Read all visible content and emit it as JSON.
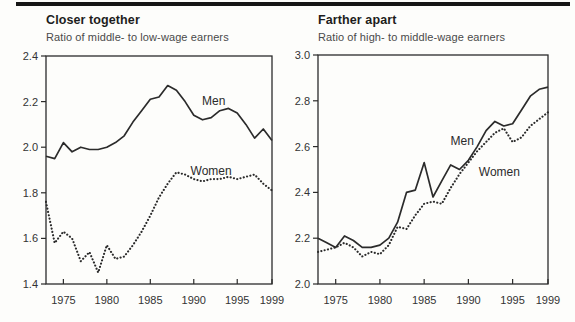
{
  "page": {
    "background": "#fdfdfb",
    "top_rule_color": "#161616",
    "line_color": "#2b2b2b"
  },
  "chart_data": [
    {
      "id": "left-panel",
      "type": "line",
      "title": "Closer together",
      "subtitle": "Ratio of middle- to low-wage earners",
      "x": [
        1973,
        1974,
        1975,
        1976,
        1977,
        1978,
        1979,
        1980,
        1981,
        1982,
        1983,
        1984,
        1985,
        1986,
        1987,
        1988,
        1989,
        1990,
        1991,
        1992,
        1993,
        1994,
        1995,
        1996,
        1997,
        1998,
        1999
      ],
      "x_ticks": [
        1975,
        1980,
        1985,
        1990,
        1995,
        1999
      ],
      "ylim": [
        1.4,
        2.4
      ],
      "y_ticks": [
        1.4,
        1.6,
        1.8,
        2.0,
        2.2,
        2.4
      ],
      "grid": false,
      "legend": "inline-labels",
      "series": [
        {
          "name": "Men",
          "style": "solid",
          "color": "#2b2b2b",
          "values": [
            1.96,
            1.95,
            2.02,
            1.98,
            2.0,
            1.99,
            1.99,
            2.0,
            2.02,
            2.05,
            2.11,
            2.16,
            2.21,
            2.22,
            2.27,
            2.25,
            2.2,
            2.14,
            2.12,
            2.13,
            2.16,
            2.17,
            2.15,
            2.1,
            2.04,
            2.08,
            2.03
          ],
          "label": {
            "x": 1992.3,
            "y": 2.185
          }
        },
        {
          "name": "Women",
          "style": "dotted",
          "color": "#2b2b2b",
          "values": [
            1.76,
            1.58,
            1.63,
            1.6,
            1.5,
            1.54,
            1.45,
            1.57,
            1.51,
            1.52,
            1.57,
            1.63,
            1.7,
            1.78,
            1.84,
            1.89,
            1.88,
            1.86,
            1.85,
            1.86,
            1.86,
            1.87,
            1.86,
            1.87,
            1.88,
            1.84,
            1.81
          ],
          "label": {
            "x": 1992.0,
            "y": 1.878
          }
        }
      ]
    },
    {
      "id": "right-panel",
      "type": "line",
      "title": "Farther apart",
      "subtitle": "Ratio of high- to middle-wage earners",
      "x": [
        1973,
        1974,
        1975,
        1976,
        1977,
        1978,
        1979,
        1980,
        1981,
        1982,
        1983,
        1984,
        1985,
        1986,
        1987,
        1988,
        1989,
        1990,
        1991,
        1992,
        1993,
        1994,
        1995,
        1996,
        1997,
        1998,
        1999
      ],
      "x_ticks": [
        1975,
        1980,
        1985,
        1990,
        1995,
        1999
      ],
      "ylim": [
        2.0,
        3.0
      ],
      "y_ticks": [
        2.0,
        2.2,
        2.4,
        2.6,
        2.8,
        3.0
      ],
      "grid": false,
      "legend": "inline-labels",
      "series": [
        {
          "name": "Men",
          "style": "solid",
          "color": "#2b2b2b",
          "values": [
            2.2,
            2.18,
            2.16,
            2.21,
            2.19,
            2.16,
            2.16,
            2.17,
            2.2,
            2.27,
            2.4,
            2.41,
            2.53,
            2.38,
            2.45,
            2.52,
            2.5,
            2.54,
            2.6,
            2.67,
            2.71,
            2.69,
            2.7,
            2.76,
            2.82,
            2.85,
            2.86
          ],
          "label": {
            "x": 1989.3,
            "y": 2.605
          }
        },
        {
          "name": "Women",
          "style": "dotted",
          "color": "#2b2b2b",
          "values": [
            2.14,
            2.15,
            2.16,
            2.18,
            2.16,
            2.12,
            2.14,
            2.13,
            2.17,
            2.25,
            2.24,
            2.3,
            2.35,
            2.36,
            2.35,
            2.42,
            2.48,
            2.53,
            2.58,
            2.62,
            2.66,
            2.68,
            2.62,
            2.64,
            2.69,
            2.72,
            2.75
          ],
          "label": {
            "x": 1993.5,
            "y": 2.472
          }
        }
      ]
    }
  ]
}
